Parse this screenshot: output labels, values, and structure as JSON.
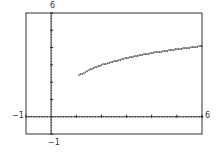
{
  "chart_data": {
    "type": "scatter",
    "title": "",
    "xlabel": "",
    "ylabel": "",
    "xlim": [
      -1,
      6
    ],
    "ylim": [
      -1,
      6
    ],
    "xscale": 1,
    "yscale": 1,
    "grid": false,
    "style": "graphing-calculator dot plot",
    "window_labels": {
      "xmin": "−1",
      "xmax": "6",
      "ymin": "−1",
      "ymax": "6"
    },
    "series": [
      {
        "name": "f(x)",
        "description": "increasing concave-down curve, approx y = 2.3 + ln(x)",
        "x": [
          1.1,
          1.5,
          2.0,
          2.5,
          3.0,
          3.5,
          4.0,
          4.5,
          5.0,
          5.5,
          6.0
        ],
        "y": [
          2.4,
          2.7,
          3.0,
          3.2,
          3.4,
          3.55,
          3.69,
          3.8,
          3.91,
          4.0,
          4.09
        ]
      }
    ]
  },
  "colors": {
    "ink": "#222222",
    "frame": "#333333",
    "background": "#ffffff"
  }
}
